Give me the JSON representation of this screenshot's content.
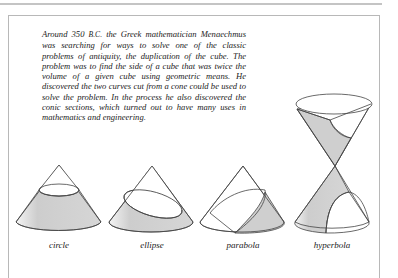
{
  "page": {
    "intro_paragraph": {
      "part1": "Around 350 ",
      "era": "B.C.",
      "part2": " the Greek mathematician Menaechmus was searching for ways to solve one of the classic problems of antiquity, the duplication of the cube. The problem was to find the side of a cube that was twice the volume of a given cube using geometric means. He discovered the two curves cut from a cone could be used to solve the problem. In the process he also discovered the conic sections, which turned out to have many uses in mathematics and engineering."
    },
    "figures": [
      {
        "label": "circle"
      },
      {
        "label": "ellipse"
      },
      {
        "label": "parabola"
      },
      {
        "label": "hyperbola"
      }
    ],
    "colors": {
      "shade": "#cfcfcf",
      "stroke": "#444444",
      "frame": "#b8b8b8"
    }
  }
}
